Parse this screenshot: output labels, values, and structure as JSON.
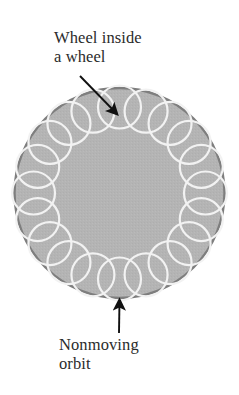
{
  "page": {
    "header_sliver": " ",
    "background_color": "#ffffff"
  },
  "figure": {
    "name": "wheel-inside-a-wheel-diagram",
    "labels": {
      "top": {
        "text": "Wheel inside\na wheel",
        "line1": "Wheel inside",
        "line2": "a wheel",
        "color": "#2b2b2b"
      },
      "bottom": {
        "text": "Nonmoving\norbit",
        "line1": "Nonmoving",
        "line2": "orbit",
        "color": "#2b2b2b"
      }
    },
    "annotations": [
      {
        "name": "pointer-to-small-wheel",
        "from_x": 80,
        "from_y": 76,
        "to_x": 119,
        "to_y": 116,
        "direction": "down-right",
        "color": "#111111"
      },
      {
        "name": "pointer-to-outer-orbit",
        "from_x": 119,
        "from_y": 333,
        "to_x": 119,
        "to_y": 297,
        "direction": "up",
        "color": "#111111"
      }
    ]
  },
  "chart_data": {
    "type": "diagram",
    "outer_disc": {
      "name": "nonmoving-orbit-disc",
      "center_x": 119.5,
      "center_y": 193,
      "radius": 105,
      "fill_color": "#b4b4b4",
      "stroke_color": "#7e7e7e",
      "stroke_width": 2.4
    },
    "inner_circles": {
      "name": "small-wheel-ring",
      "count": 20,
      "ring_radius": 86,
      "circle_radius": 21.5,
      "stroke_color": "#f2f2f2",
      "stroke_width": 2.2,
      "fill": "none",
      "start_angle_deg": -90
    },
    "labels": [
      "Wheel inside a wheel",
      "Nonmoving orbit"
    ],
    "legend": []
  }
}
